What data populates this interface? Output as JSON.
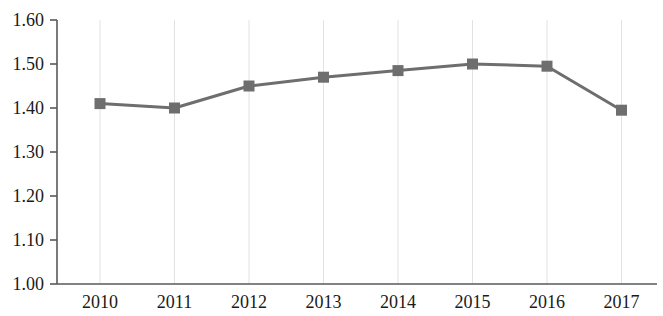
{
  "chart_data": {
    "type": "line",
    "title": "",
    "subtitle": "",
    "xlabel": "",
    "ylabel": "",
    "categories": [
      "2010",
      "2011",
      "2012",
      "2013",
      "2014",
      "2015",
      "2016",
      "2017"
    ],
    "values": [
      1.41,
      1.4,
      1.45,
      1.47,
      1.485,
      1.5,
      1.495,
      1.395
    ],
    "series": [
      {
        "name": "",
        "values": [
          1.41,
          1.4,
          1.45,
          1.47,
          1.485,
          1.5,
          1.495,
          1.395
        ]
      }
    ],
    "ylim": [
      1.0,
      1.6
    ],
    "ytick_values": [
      1.0,
      1.1,
      1.2,
      1.3,
      1.4,
      1.5,
      1.6
    ],
    "ytick_labels": [
      "1.00",
      "1.10",
      "1.20",
      "1.30",
      "1.40",
      "1.50",
      "1.60"
    ],
    "xtick_labels": [
      "2010",
      "2011",
      "2012",
      "2013",
      "2014",
      "2015",
      "2016",
      "2017"
    ],
    "grid": "vertical-only",
    "legend": "none",
    "marker": "square",
    "series_color": "#6e6e6e",
    "marker_color": "#6e6e6e",
    "gridline_color": "#e2e2e2",
    "axis_color": "#595959",
    "text_color": "#1a1a1a",
    "background_color": "#ffffff"
  }
}
